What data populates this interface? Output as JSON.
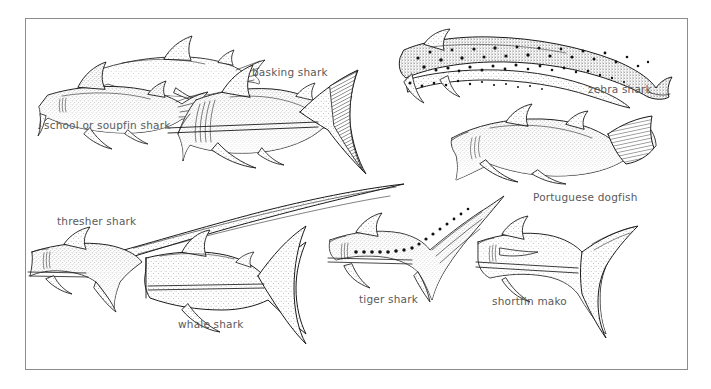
{
  "plate": {
    "title": "shark body-form comparison plate",
    "style": "stippled pen-and-ink scientific illustration",
    "background_color": "#ffffff",
    "frame_color": "#8c8c8c",
    "ink_color": "#1a1a1a",
    "label_color": "#5a5a5a"
  },
  "labels": [
    {
      "id": "school-or-soupfin-shark",
      "text": "school or soupfin shark",
      "x": 44,
      "y": 120
    },
    {
      "id": "basking-shark",
      "text": "basking shark",
      "x": 252,
      "y": 67
    },
    {
      "id": "zebra-shark",
      "text": "zebra shark",
      "x": 588,
      "y": 84
    },
    {
      "id": "portuguese-dogfish",
      "text": "Portuguese dogfish",
      "x": 533,
      "y": 192
    },
    {
      "id": "thresher-shark",
      "text": "thresher shark",
      "x": 57,
      "y": 216
    },
    {
      "id": "whale-shark",
      "text": "whale shark",
      "x": 178,
      "y": 319
    },
    {
      "id": "tiger-shark",
      "text": "tiger shark",
      "x": 359,
      "y": 294
    },
    {
      "id": "shortfin-mako",
      "text": "shortfin mako",
      "x": 492,
      "y": 296
    }
  ],
  "specimens": [
    {
      "id": "school-or-soupfin-shark",
      "name": "school or soupfin shark",
      "markings": "plain stipple"
    },
    {
      "id": "basking-shark",
      "name": "basking shark",
      "markings": "plain stipple, large crescent caudal"
    },
    {
      "id": "zebra-shark",
      "name": "zebra shark",
      "markings": "bold dark spots"
    },
    {
      "id": "portuguese-dogfish",
      "name": "Portuguese dogfish",
      "markings": "plain stipple, blunt caudal"
    },
    {
      "id": "thresher-shark",
      "name": "thresher shark",
      "markings": "elongated upper caudal lobe"
    },
    {
      "id": "whale-shark",
      "name": "whale shark",
      "markings": "pale stipple, broad caudal"
    },
    {
      "id": "tiger-shark",
      "name": "tiger shark",
      "markings": "row of dark spots along flank"
    },
    {
      "id": "shortfin-mako",
      "name": "shortfin mako",
      "markings": "plain stipple, lunate caudal"
    }
  ]
}
